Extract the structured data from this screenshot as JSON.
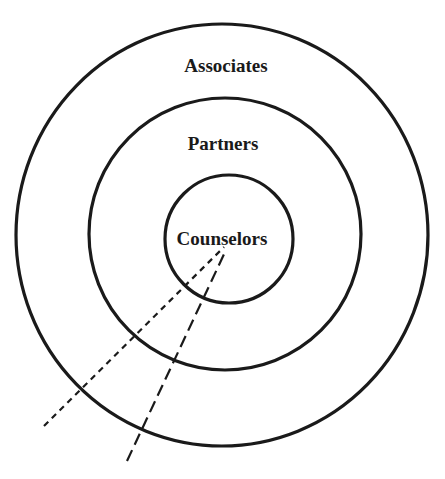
{
  "diagram": {
    "type": "concentric-circles",
    "rings": [
      {
        "id": "outer",
        "label": "Associates"
      },
      {
        "id": "middle",
        "label": "Partners"
      },
      {
        "id": "inner",
        "label": "Counselors"
      }
    ],
    "colors": {
      "stroke": "#1a1a1a",
      "background": "#ffffff"
    }
  }
}
